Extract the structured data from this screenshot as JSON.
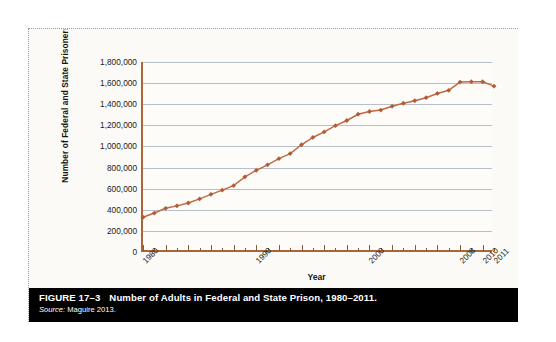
{
  "figure": {
    "caption_number": "FIGURE 17–3",
    "caption_title": "Number of Adults in Federal and State Prison, 1980–2011.",
    "source_label": "Source:",
    "source_text": "Maguire 2013."
  },
  "chart_data": {
    "type": "line",
    "title": "",
    "xlabel": "Year",
    "ylabel": "Number of Federal and State Prisoners",
    "ylim": [
      0,
      1800000
    ],
    "ytick_values": [
      0,
      200000,
      400000,
      600000,
      800000,
      1000000,
      1200000,
      1400000,
      1600000,
      1800000
    ],
    "ytick_labels": [
      "0",
      "200,000",
      "400,000",
      "600,000",
      "800,000",
      "1,000,000",
      "1,200,000",
      "1,400,000",
      "1,600,000",
      "1,800,000"
    ],
    "xlim": [
      1980,
      2011
    ],
    "xtick_labels": [
      "1980",
      "1990",
      "2000",
      "2008",
      "2010",
      "2011"
    ],
    "xtick_positions": [
      1980,
      1990,
      2000,
      2008,
      2010,
      2011
    ],
    "grid": "horizontal",
    "legend": "none",
    "marker": "diamond",
    "line_color": "#bd6a45",
    "marker_color": "#b15c36",
    "axis_color": "#a9663b",
    "grid_color": "#b9bfca",
    "x": [
      1980,
      1981,
      1982,
      1983,
      1984,
      1985,
      1986,
      1987,
      1988,
      1989,
      1990,
      1991,
      1992,
      1993,
      1994,
      1995,
      1996,
      1997,
      1998,
      1999,
      2000,
      2001,
      2002,
      2003,
      2004,
      2005,
      2006,
      2007,
      2008,
      2009,
      2010,
      2011
    ],
    "values": [
      329000,
      369000,
      414000,
      437000,
      464000,
      503000,
      546000,
      586000,
      628000,
      712000,
      774000,
      826000,
      884000,
      932000,
      1016000,
      1085000,
      1138000,
      1197000,
      1246000,
      1305000,
      1331000,
      1345000,
      1380000,
      1409000,
      1433000,
      1462000,
      1502000,
      1532000,
      1610000,
      1614000,
      1613000,
      1571000
    ]
  }
}
